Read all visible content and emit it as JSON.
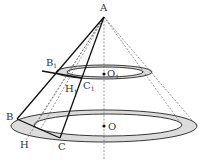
{
  "diagram": {
    "type": "geometry-cone",
    "labels": {
      "A": "A",
      "B1": "B",
      "B1_sub": "1",
      "O1": "O",
      "O1_sub": "1",
      "H1": "H",
      "H1_sub": "1",
      "C1": "C",
      "C1_sub": "1",
      "B": "B",
      "O": "O",
      "H": "H",
      "C": "C"
    },
    "colors": {
      "stroke": "#111111",
      "dashed": "#555555",
      "ring_fill": "#d9d9d9"
    }
  }
}
